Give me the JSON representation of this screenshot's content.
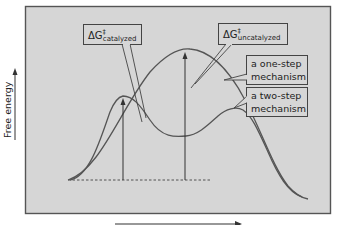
{
  "diagram": {
    "y_axis_label": "Free energy",
    "x_axis_label": "",
    "colors": {
      "background": "#ffffff",
      "plot_area": "#d6d6d6",
      "frame": "#555555",
      "curve": "#555555",
      "text": "#222222",
      "label_box": "#d6d6d6"
    },
    "labels": {
      "delta_g_symbol": "ΔG",
      "double_dagger": "‡",
      "catalyzed_sub": "catalyzed",
      "uncatalyzed_sub": "uncatalyzed",
      "one_step_line1": "a one-step",
      "one_step_line2": "mechanism",
      "two_step_line1": "a two-step",
      "two_step_line2": "mechanism"
    },
    "curves": [
      {
        "name": "one-step mechanism",
        "peaks": 1
      },
      {
        "name": "two-step mechanism",
        "peaks": 2
      }
    ]
  }
}
